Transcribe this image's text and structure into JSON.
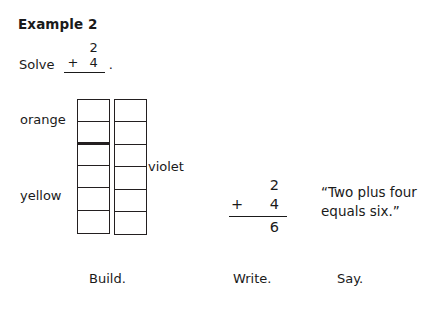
{
  "header": {
    "title": "Example 2"
  },
  "solve_prompt": {
    "label": "Solve",
    "top_addend": "2",
    "operator": "+",
    "bottom_addend": "4",
    "period": "."
  },
  "build": {
    "caption": "Build.",
    "towers": [
      {
        "name": "left-tower",
        "total_cubes": 6,
        "groups": [
          {
            "color_label": "orange",
            "count": 2
          },
          {
            "color_label": "yellow",
            "count": 4
          }
        ]
      },
      {
        "name": "right-tower",
        "total_cubes": 6,
        "groups": [
          {
            "color_label": "violet",
            "count": 6
          }
        ]
      }
    ],
    "labels": {
      "orange": "orange",
      "yellow": "yellow",
      "violet": "violet"
    }
  },
  "write": {
    "caption": "Write.",
    "top_addend": "2",
    "operator": "+",
    "bottom_addend": "4",
    "sum": "6"
  },
  "say": {
    "caption": "Say.",
    "line1": "“Two plus four",
    "line2": "equals six.”"
  },
  "colors": {
    "ink": "#231f20",
    "page": "#ffffff"
  }
}
